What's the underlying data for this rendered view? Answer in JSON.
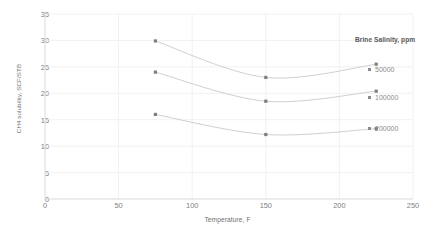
{
  "chart_data": {
    "type": "line",
    "title": "",
    "xlabel": "Temperature, F",
    "ylabel": "CH4 solubility, SCF/STB",
    "xlim": [
      0,
      250
    ],
    "ylim": [
      0,
      35
    ],
    "xticks": [
      "0",
      "50",
      "100",
      "150",
      "200",
      "250"
    ],
    "yticks": [
      "0",
      "5",
      "10",
      "15",
      "20",
      "25",
      "30",
      "35"
    ],
    "grid": true,
    "legend_position": "right",
    "legend_title": "Brine Salinity, ppm",
    "x": [
      75,
      150,
      225
    ],
    "series": [
      {
        "name": "50000",
        "values": [
          29.9,
          23.0,
          25.5
        ]
      },
      {
        "name": "100000",
        "values": [
          24.0,
          18.5,
          20.4
        ]
      },
      {
        "name": "200000",
        "values": [
          16.0,
          12.2,
          13.3
        ]
      }
    ],
    "colors": {
      "marker": "#7f7f7f",
      "line": "#c9c9c9",
      "grid": "#ededed",
      "axis": "#d9d9d9",
      "tick_text": "#808080",
      "title_text": "#595959"
    }
  }
}
